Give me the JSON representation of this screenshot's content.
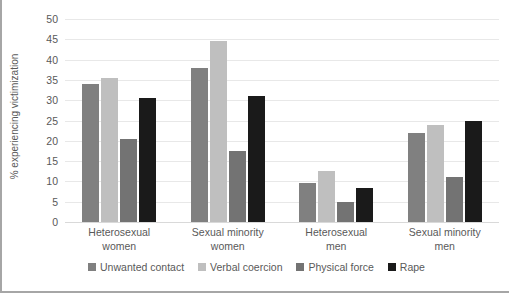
{
  "chart_data": {
    "type": "bar",
    "title": "",
    "xlabel": "",
    "ylabel": "% experiencing victimization",
    "ylim": [
      0,
      50
    ],
    "yticks": [
      50,
      45,
      40,
      35,
      30,
      25,
      20,
      15,
      10,
      5,
      0
    ],
    "grid": true,
    "legend_position": "bottom",
    "categories": [
      "Heterosexual women",
      "Sexual minority women",
      "Heterosexual men",
      "Sexual minority men"
    ],
    "categories_lines": [
      [
        "Heterosexual",
        "women"
      ],
      [
        "Sexual minority",
        "women"
      ],
      [
        "Heterosexual",
        "men"
      ],
      [
        "Sexual minority",
        "men"
      ]
    ],
    "series": [
      {
        "name": "Unwanted contact",
        "color": "#808080",
        "values": [
          34,
          38,
          9.5,
          22
        ]
      },
      {
        "name": "Verbal coercion",
        "color": "#bfbfbf",
        "values": [
          35.5,
          44.5,
          12.5,
          24
        ]
      },
      {
        "name": "Physical force",
        "color": "#737373",
        "values": [
          20.5,
          17.5,
          5,
          11
        ]
      },
      {
        "name": "Rape",
        "color": "#1a1a1a",
        "values": [
          30.5,
          31,
          8.5,
          25
        ]
      }
    ]
  },
  "colors": {
    "grid": "#e8e8e8",
    "axis_text": "#595959",
    "border": "#a6a6a6",
    "background": "#ffffff"
  }
}
